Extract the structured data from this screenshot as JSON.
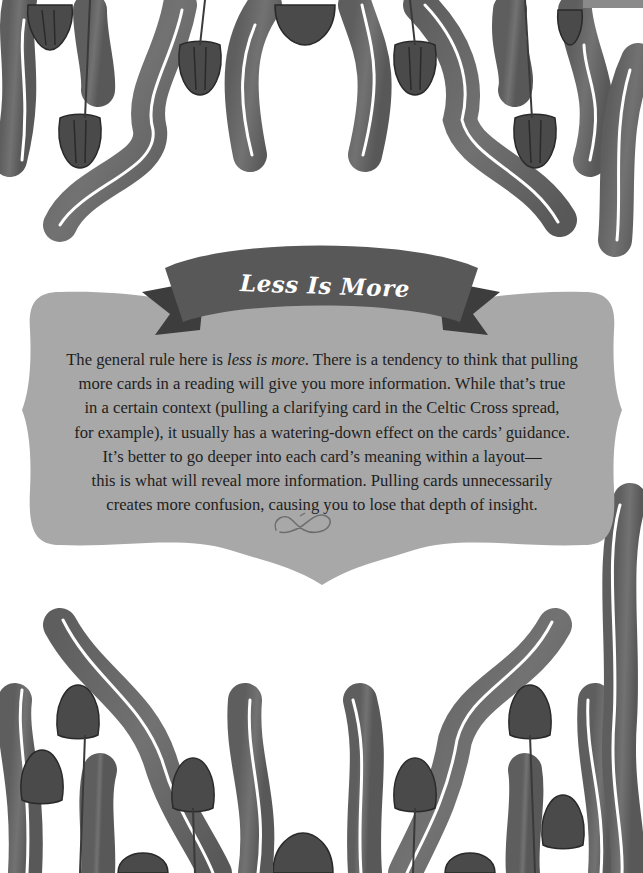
{
  "page": {
    "background": "#ffffff",
    "decoration": "watercolor-style gray wavy stems with hanging tulip flowers along top and bottom borders"
  },
  "banner": {
    "title": "Less Is More",
    "ribbon_color": "#5a5a5a",
    "ribbon_tail_color": "#3f3f3f",
    "title_color": "#ffffff"
  },
  "plaque": {
    "color": "#a8a8a8",
    "lines": [
      {
        "before": "The general rule here is ",
        "emph": "less is more",
        "after": ". There is a tendency to think that pulling"
      },
      {
        "text": "more cards in a reading will give you more information. While that’s true"
      },
      {
        "text": "in a certain context (pulling a clarifying card in the Celtic Cross spread,"
      },
      {
        "text": "for example), it usually has a watering-down effect on the cards’ guidance."
      },
      {
        "text": "It’s better to go deeper into each card’s meaning within a layout—"
      },
      {
        "text": "this is what will reveal more information. Pulling cards unnecessarily"
      },
      {
        "text": "creates more confusion, causing you to lose that depth of insight."
      }
    ],
    "ornament": "infinity-flourish-icon"
  }
}
